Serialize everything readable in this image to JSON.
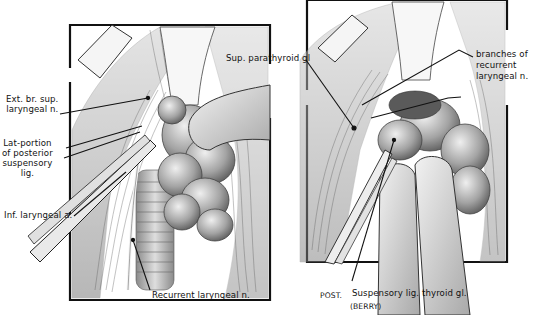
{
  "figure": {
    "left_panel": {
      "name": "left-panel",
      "labels": [
        {
          "id": "ext-br-sup-laryngeal-n",
          "text": "Ext. br. sup.\nlaryngeal n."
        },
        {
          "id": "lat-portion-posterior-suspensory-lig",
          "text": "Lat-portion\nof posterior\nsuspensory\nlig."
        },
        {
          "id": "inf-laryngeal-a",
          "text": "Inf. laryngeal a."
        },
        {
          "id": "recurrent-laryngeal-n",
          "text": "Recurrent laryngeal n."
        }
      ]
    },
    "right_panel": {
      "name": "right-panel",
      "labels": [
        {
          "id": "sup-parathyroid-gl",
          "text": "Sup. parathyroid gl"
        },
        {
          "id": "branches-of-recurrent-laryngeal-n",
          "text": "branches of\nrecurrent\nlaryngeal n."
        },
        {
          "id": "post",
          "text": "POST."
        },
        {
          "id": "suspensory-lig-thyroid-gl",
          "text": "Suspensory lig. thyroid gl."
        },
        {
          "id": "berry",
          "text": "(BERRY)"
        }
      ]
    }
  },
  "colors": {
    "ink": "#111111",
    "paper": "#ffffff",
    "tissue_light": "#d8d8d8",
    "tissue_mid": "#9a9a9a",
    "tissue_dark": "#4a4a4a"
  }
}
